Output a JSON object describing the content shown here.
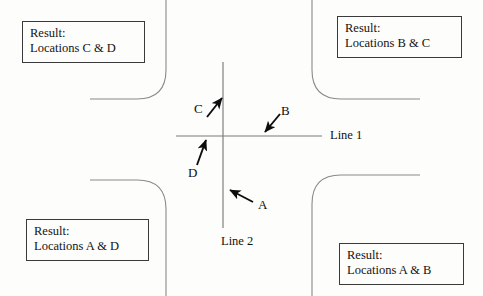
{
  "diagram": {
    "background_color": "#fdfdfc",
    "line_color": "#7b7b7b",
    "arrow_color": "#0d0d0d",
    "box_border_color": "#3a3a3a",
    "text_color": "#131313"
  },
  "axes": {
    "horizontal": {
      "label": "Line 1",
      "name": "line-1"
    },
    "vertical": {
      "label": "Line 2",
      "name": "line-2"
    }
  },
  "arrows": [
    {
      "id": "C",
      "label": "C",
      "direction": "up-right",
      "points_to": "vertical-line-upper",
      "tail": [
        207,
        118
      ],
      "head": [
        224,
        97
      ]
    },
    {
      "id": "B",
      "label": "B",
      "direction": "down-left",
      "points_to": "horizontal-line-right",
      "tail": [
        281,
        116
      ],
      "head": [
        263,
        134
      ]
    },
    {
      "id": "D",
      "label": "D",
      "direction": "up",
      "points_to": "horizontal-line-left",
      "tail": [
        198,
        166
      ],
      "head": [
        207,
        138
      ]
    },
    {
      "id": "A",
      "label": "A",
      "direction": "up-left",
      "points_to": "vertical-line-lower",
      "tail": [
        254,
        203
      ],
      "head": [
        228,
        189
      ]
    }
  ],
  "result_boxes": [
    {
      "name": "result-box-cd",
      "quadrant": "top-left",
      "heading": "Result:",
      "detail": "Locations C & D"
    },
    {
      "name": "result-box-bc",
      "quadrant": "top-right",
      "heading": "Result:",
      "detail": "Locations B & C"
    },
    {
      "name": "result-box-ad",
      "quadrant": "bottom-left",
      "heading": "Result:",
      "detail": "Locations A & D"
    },
    {
      "name": "result-box-ab",
      "quadrant": "bottom-right",
      "heading": "Result:",
      "detail": "Locations A & B"
    }
  ]
}
